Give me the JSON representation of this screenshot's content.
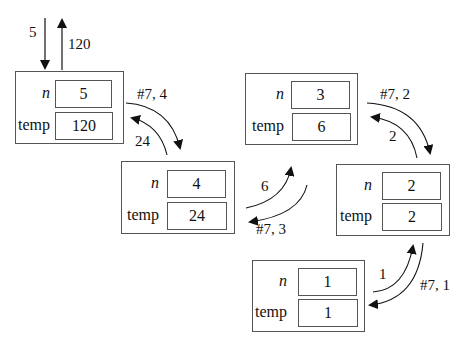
{
  "diagram": {
    "type": "recursive-call-frames",
    "initial_call": {
      "argument": "5",
      "return_value": "120"
    },
    "frames": [
      {
        "n_label": "n",
        "temp_label": "temp",
        "n": "5",
        "temp": "120"
      },
      {
        "n_label": "n",
        "temp_label": "temp",
        "n": "4",
        "temp": "24"
      },
      {
        "n_label": "n",
        "temp_label": "temp",
        "n": "3",
        "temp": "6"
      },
      {
        "n_label": "n",
        "temp_label": "temp",
        "n": "2",
        "temp": "2"
      },
      {
        "n_label": "n",
        "temp_label": "temp",
        "n": "1",
        "temp": "1"
      }
    ],
    "calls": [
      {
        "from": 0,
        "to": 1,
        "label": "#7, 4"
      },
      {
        "from": 1,
        "to": 2,
        "label": "#7, 3"
      },
      {
        "from": 2,
        "to": 3,
        "label": "#7, 2"
      },
      {
        "from": 3,
        "to": 4,
        "label": "#7, 1"
      }
    ],
    "returns": [
      {
        "from": 1,
        "to": 0,
        "label": "24"
      },
      {
        "from": 2,
        "to": 1,
        "label": "6"
      },
      {
        "from": 3,
        "to": 2,
        "label": "2"
      },
      {
        "from": 4,
        "to": 3,
        "label": "1"
      }
    ]
  }
}
